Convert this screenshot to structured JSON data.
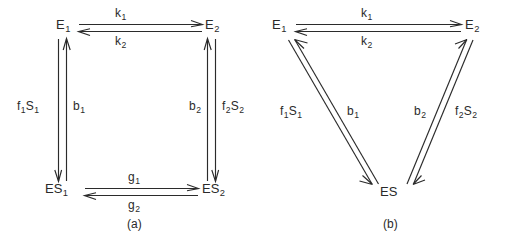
{
  "figure": {
    "type": "kinetic-scheme-diagram",
    "background_color": "#ffffff",
    "ink_color": "#2b2b2b"
  },
  "panels": [
    {
      "id": "a",
      "caption": "(a)",
      "layout": "square-cycle",
      "nodes": [
        {
          "id": "E1",
          "base": "E",
          "sub": "1",
          "position": "top-left"
        },
        {
          "id": "E2",
          "base": "E",
          "sub": "2",
          "position": "top-right"
        },
        {
          "id": "ES1",
          "base": "ES",
          "sub": "1",
          "position": "bottom-left"
        },
        {
          "id": "ES2",
          "base": "ES",
          "sub": "2",
          "position": "bottom-right"
        }
      ],
      "rates": [
        {
          "id": "k1",
          "base": "k",
          "sub": "1",
          "from": "E1",
          "to": "E2",
          "edge": "top",
          "direction": "forward"
        },
        {
          "id": "k2",
          "base": "k",
          "sub": "2",
          "from": "E2",
          "to": "E1",
          "edge": "top",
          "direction": "reverse"
        },
        {
          "id": "f1S1",
          "base": "f",
          "sub": "1",
          "base2": "S",
          "sub2": "1",
          "from": "E1",
          "to": "ES1",
          "edge": "left",
          "direction": "down"
        },
        {
          "id": "b1",
          "base": "b",
          "sub": "1",
          "from": "ES1",
          "to": "E1",
          "edge": "left",
          "direction": "up"
        },
        {
          "id": "b2",
          "base": "b",
          "sub": "2",
          "from": "ES2",
          "to": "E2",
          "edge": "right",
          "direction": "up"
        },
        {
          "id": "f2S2",
          "base": "f",
          "sub": "2",
          "base2": "S",
          "sub2": "2",
          "from": "E2",
          "to": "ES2",
          "edge": "right",
          "direction": "down"
        },
        {
          "id": "g1",
          "base": "g",
          "sub": "1",
          "from": "ES1",
          "to": "ES2",
          "edge": "bottom",
          "direction": "forward"
        },
        {
          "id": "g2",
          "base": "g",
          "sub": "2",
          "from": "ES2",
          "to": "ES1",
          "edge": "bottom",
          "direction": "reverse"
        }
      ]
    },
    {
      "id": "b",
      "caption": "(b)",
      "layout": "triangle-cycle",
      "nodes": [
        {
          "id": "E1",
          "base": "E",
          "sub": "1",
          "position": "top-left"
        },
        {
          "id": "E2",
          "base": "E",
          "sub": "2",
          "position": "top-right"
        },
        {
          "id": "ES",
          "base": "ES",
          "sub": "",
          "position": "bottom-center"
        }
      ],
      "rates": [
        {
          "id": "k1",
          "base": "k",
          "sub": "1",
          "from": "E1",
          "to": "E2",
          "edge": "top",
          "direction": "forward"
        },
        {
          "id": "k2",
          "base": "k",
          "sub": "2",
          "from": "E2",
          "to": "E1",
          "edge": "top",
          "direction": "reverse"
        },
        {
          "id": "f1S1",
          "base": "f",
          "sub": "1",
          "base2": "S",
          "sub2": "1",
          "from": "E1",
          "to": "ES",
          "edge": "left-diagonal",
          "direction": "down"
        },
        {
          "id": "b1",
          "base": "b",
          "sub": "1",
          "from": "ES",
          "to": "E1",
          "edge": "left-diagonal",
          "direction": "up"
        },
        {
          "id": "b2",
          "base": "b",
          "sub": "2",
          "from": "ES",
          "to": "E2",
          "edge": "right-diagonal",
          "direction": "up"
        },
        {
          "id": "f2S2",
          "base": "f",
          "sub": "2",
          "base2": "S",
          "sub2": "2",
          "from": "E2",
          "to": "ES",
          "edge": "right-diagonal",
          "direction": "down"
        }
      ]
    }
  ]
}
